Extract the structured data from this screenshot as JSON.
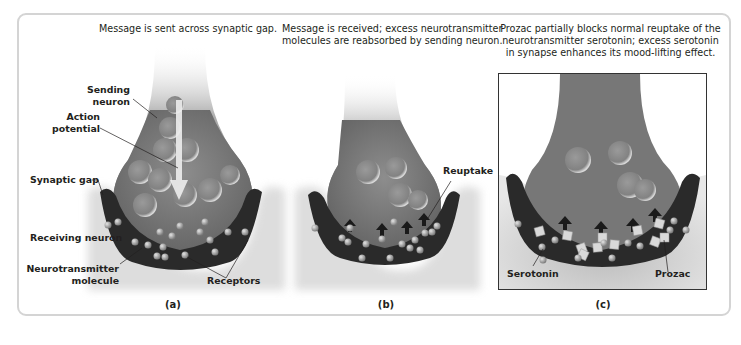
{
  "figure": {
    "panels": [
      {
        "id": "a",
        "letter": "(a)",
        "caption": "Message is sent across synaptic gap.",
        "labels": {
          "sending_neuron": "Sending\nneuron",
          "action_potential": "Action\npotential",
          "synaptic_gap": "Synaptic gap",
          "receiving_neuron": "Receiving neuron",
          "neurotransmitter_molecule": "Neurotransmitter\nmolecule",
          "receptors": "Receptors"
        }
      },
      {
        "id": "b",
        "letter": "(b)",
        "caption": "Message is received; excess neurotransmitter molecules are reabsorbed by sending neuron.",
        "labels": {
          "reuptake": "Reuptake"
        }
      },
      {
        "id": "c",
        "letter": "(c)",
        "caption": "Prozac partially blocks normal reuptake of the neurotransmitter serotonin; excess serotonin in synapse enhances its mood-lifting effect.",
        "labels": {
          "serotonin": "Serotonin",
          "prozac": "Prozac"
        }
      }
    ],
    "colors": {
      "frame_border": "#d4d4d4",
      "neuron_fill": "#7a7a7a",
      "receiving_neuron": "#2b2b2b",
      "molecule": "#b0b0b0",
      "prozac_cube": "#d9d9d9",
      "text": "#231f20"
    }
  }
}
